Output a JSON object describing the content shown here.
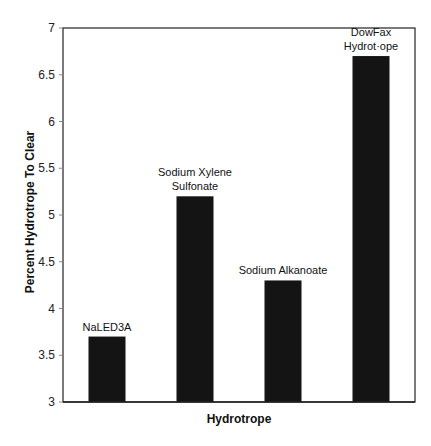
{
  "chart_data": {
    "type": "bar",
    "title": "",
    "xlabel": "Hydrotrope",
    "ylabel": "Percent Hydrotrope To Clear",
    "ylim": [
      3,
      7
    ],
    "yticks": [
      3,
      3.5,
      4,
      4.5,
      5,
      5.5,
      6,
      6.5,
      7
    ],
    "ytick_labels": [
      "3",
      "3.5",
      "4",
      "4.5",
      "5",
      "5.5",
      "6",
      "6.5",
      "7"
    ],
    "grid": false,
    "legend": null,
    "categories": [
      "NaLED3A",
      "Sodium Xylene Sulfonate",
      "Sodium Alkanoate",
      "DowFax Hydrotrope"
    ],
    "bar_labels": [
      [
        "NaLED3A"
      ],
      [
        "Sodium Xylene",
        "Sulfonate"
      ],
      [
        "Sodium Alkanoate"
      ],
      [
        "DowFax",
        "Hydrot·ope"
      ]
    ],
    "values": [
      3.7,
      5.2,
      4.3,
      6.7
    ],
    "bar_color": "#141414"
  }
}
